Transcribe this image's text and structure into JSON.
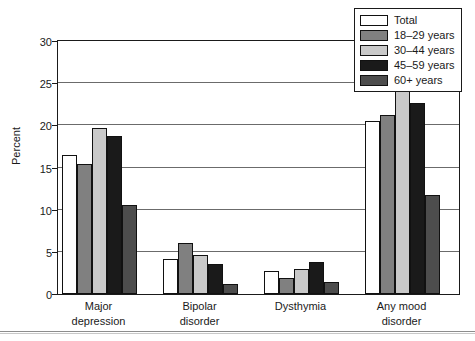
{
  "chart_data": {
    "type": "bar",
    "title": "",
    "subtitle": "",
    "xlabel": "",
    "ylabel": "Percent",
    "ylim": [
      0,
      30
    ],
    "ytick_values": [
      0,
      5,
      10,
      15,
      20,
      25,
      30
    ],
    "ytick_labels": [
      "0",
      "5",
      "10",
      "15",
      "20",
      "25",
      "30"
    ],
    "grid": true,
    "legend_position": "top-right",
    "categories": [
      "Major depression",
      "Bipolar disorder",
      "Dysthymia",
      "Any mood disorder"
    ],
    "category_lines": [
      [
        "Major",
        "depression"
      ],
      [
        "Bipolar",
        "disorder"
      ],
      [
        "Dysthymia",
        ""
      ],
      [
        "Any mood",
        "disorder"
      ]
    ],
    "series": [
      {
        "name": "Total",
        "color": "#ffffff",
        "values": [
          16.5,
          4.1,
          2.7,
          20.5
        ]
      },
      {
        "name": "18–29 years",
        "color": "#808080",
        "values": [
          15.4,
          6.0,
          1.9,
          21.2
        ]
      },
      {
        "name": "30–44 years",
        "color": "#c9c9c9",
        "values": [
          19.7,
          4.6,
          3.0,
          24.5
        ]
      },
      {
        "name": "45–59 years",
        "color": "#1a1a1a",
        "values": [
          18.7,
          3.6,
          3.8,
          22.6
        ]
      },
      {
        "name": "60+ years",
        "color": "#4d4d4d",
        "values": [
          10.5,
          1.2,
          1.4,
          11.8
        ]
      }
    ]
  },
  "legend": {
    "items": [
      {
        "label": "Total"
      },
      {
        "label": "18–29 years"
      },
      {
        "label": "30–44 years"
      },
      {
        "label": "45–59 years"
      },
      {
        "label": "60+ years"
      }
    ]
  },
  "axis": {
    "y_title": "Percent"
  },
  "colors": {
    "axis": "#1a1a1a",
    "grid": "#6b6b6b",
    "background": "#ffffff",
    "bar_outline": "#111111"
  }
}
